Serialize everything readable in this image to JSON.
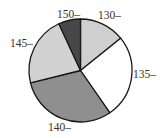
{
  "chart_data": {
    "type": "pie",
    "title": "",
    "categories": [
      "130",
      "135",
      "140",
      "145",
      "150"
    ],
    "labels": [
      "130–",
      "135–",
      "140–",
      "145–",
      "150–"
    ],
    "values": [
      14.2,
      26.1,
      30.8,
      21.9,
      6.9
    ],
    "start_angle_deg": 0,
    "direction": "clockwise",
    "colors": [
      "#cfcfcf",
      "#ffffff",
      "#8f8f8f",
      "#d2d2d2",
      "#474747"
    ],
    "legend": "none",
    "label_positions": [
      {
        "x": 98,
        "y": 19,
        "anchor": "start"
      },
      {
        "x": 133,
        "y": 78,
        "anchor": "start"
      },
      {
        "x": 48,
        "y": 131,
        "anchor": "start"
      },
      {
        "x": 10,
        "y": 47,
        "anchor": "start"
      },
      {
        "x": 57,
        "y": 18,
        "anchor": "start"
      }
    ],
    "center": {
      "x": 80.5,
      "y": 70.5
    },
    "radius": 51.5
  }
}
